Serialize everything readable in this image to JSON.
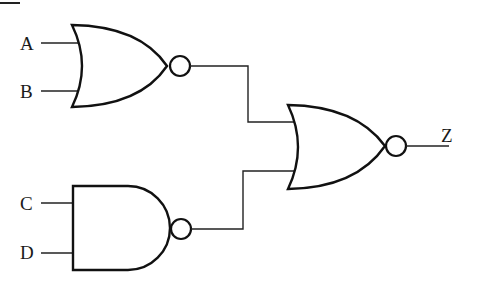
{
  "diagram": {
    "type": "logic-circuit",
    "inputs": [
      {
        "label": "A",
        "gate": "nor1"
      },
      {
        "label": "B",
        "gate": "nor1"
      },
      {
        "label": "C",
        "gate": "nand1"
      },
      {
        "label": "D",
        "gate": "nand1"
      }
    ],
    "gates": [
      {
        "id": "nor1",
        "type": "NOR",
        "inputs": [
          "A",
          "B"
        ]
      },
      {
        "id": "nand1",
        "type": "NAND",
        "inputs": [
          "C",
          "D"
        ]
      },
      {
        "id": "nor2",
        "type": "NOR",
        "inputs": [
          "nor1",
          "nand1"
        ],
        "output": "Z"
      }
    ],
    "output": {
      "label": "Z"
    }
  }
}
